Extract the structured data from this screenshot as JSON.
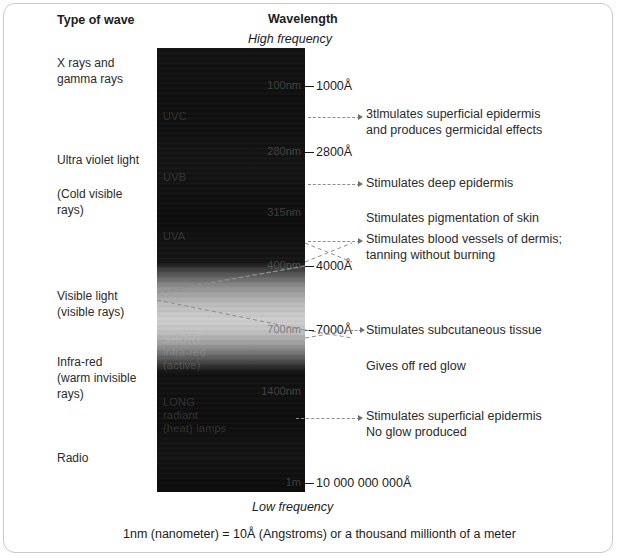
{
  "headers": {
    "type_of_wave": "Type of wave",
    "wavelength": "Wavelength",
    "high_frequency": "High frequency",
    "low_frequency": "Low frequency"
  },
  "wave_types": [
    {
      "key": "xray",
      "label": "X rays and\ngamma rays"
    },
    {
      "key": "uv",
      "label": "Ultra violet light"
    },
    {
      "key": "uvcold",
      "label": "(Cold visible\nrays)"
    },
    {
      "key": "visible",
      "label": "Visible light\n(visible rays)"
    },
    {
      "key": "ir",
      "label": "Infra-red\n(warm invisible\nrays)"
    },
    {
      "key": "radio",
      "label": "Radio"
    }
  ],
  "bands": [
    {
      "key": "uvc",
      "label": "UVC"
    },
    {
      "key": "uvb",
      "label": "UVB"
    },
    {
      "key": "uva",
      "label": "UVA"
    },
    {
      "key": "short",
      "label": "SHORT\ninfra-red\n(active)"
    },
    {
      "key": "long",
      "label": "LONG\nradiant\n(heat) lamps"
    }
  ],
  "nm_marks": [
    {
      "key": "nm100",
      "label": "100nm"
    },
    {
      "key": "nm280",
      "label": "280nm"
    },
    {
      "key": "nm315",
      "label": "315nm"
    },
    {
      "key": "nm400",
      "label": "400nm"
    },
    {
      "key": "nm700",
      "label": "700nm"
    },
    {
      "key": "nm1400",
      "label": "1400nm"
    },
    {
      "key": "nm1m",
      "label": "1m"
    }
  ],
  "angstrom_marks": [
    {
      "key": "a1000",
      "label": "1000Å"
    },
    {
      "key": "a2800",
      "label": "2800Å"
    },
    {
      "key": "a4000",
      "label": "4000Å"
    },
    {
      "key": "a7000",
      "label": "7000Å"
    },
    {
      "key": "a10e10",
      "label": "10 000 000 000Å"
    }
  ],
  "notes": [
    {
      "key": "germicidal",
      "label": "3tlmulates superficial epidermis\nand produces germicidal effects"
    },
    {
      "key": "deep",
      "label": "Stimulates deep epidermis"
    },
    {
      "key": "pigment",
      "label": "Stimulates pigmentation of skin"
    },
    {
      "key": "blood",
      "label": "Stimulates blood vessels of dermis;\ntanning without burning"
    },
    {
      "key": "subcutaneous",
      "label": "Stimulates subcutaneous tissue"
    },
    {
      "key": "redglow",
      "label": "Gives off red glow"
    },
    {
      "key": "noglow",
      "label": "Stimulates superficial epidermis\nNo glow produced"
    }
  ],
  "caption": "1nm (nanometer) =  10Å (Angstroms) or a thousand millionth of a meter",
  "colors": {
    "border": "#c9c9c9",
    "text": "#2b2b2b",
    "heading": "#1c1c1c",
    "bar_dark": "#0d0d0d",
    "visible_peak": "#cfcfcf",
    "leader": "#8d8d8d"
  }
}
